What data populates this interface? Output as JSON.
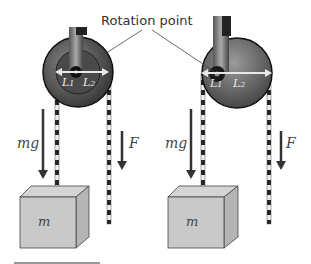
{
  "annotation": {
    "label": "Rotation point"
  },
  "left_pulley": {
    "lever_left": "L",
    "lever_left_sub": "1",
    "lever_right": "L",
    "lever_right_sub": "2",
    "weight_label": "mg",
    "force_label": "F",
    "mass_label": "m"
  },
  "right_pulley": {
    "lever_left": "L",
    "lever_left_sub": "1",
    "lever_right": "L",
    "lever_right_sub": "2",
    "weight_label": "mg",
    "force_label": "F",
    "mass_label": "m"
  },
  "colors": {
    "wheel_dark": "#2a2a2a",
    "wheel_mid": "#6a6a6a",
    "box_front": "#c8c8c8",
    "box_side": "#b0b0b0",
    "box_top": "#d6d6d6",
    "arrow": "#333333"
  }
}
